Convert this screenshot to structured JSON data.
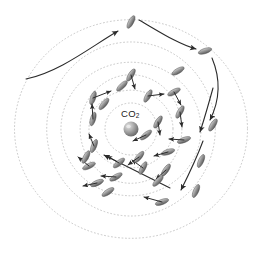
{
  "figure": {
    "background_color": "#ffffff",
    "width": 258,
    "height": 265
  },
  "center_label": {
    "text": "CO",
    "subscript": "2",
    "full_text": "CO2",
    "x": 121,
    "y": 108,
    "color": "#1a1a1a",
    "font_size": 9.5
  },
  "center_sphere": {
    "name": "co2-sphere",
    "cx": 131,
    "cy": 129,
    "r": 7.5,
    "fill_light": "#d8d8d8",
    "fill_mid": "#a8a8a8",
    "fill_dark": "#6f6f6f",
    "highlight_offset": [
      -2.5,
      -2.5
    ]
  },
  "rings": {
    "name": "dotted-orbital-rings",
    "color": "#b9b9b9",
    "stroke_width": 0.8,
    "dash": "0.9 2.6",
    "center": [
      131,
      129
    ],
    "count": 6,
    "radii": [
      26,
      40,
      53,
      68,
      86,
      112
    ],
    "wobble": [
      0.0,
      0.05,
      -0.04,
      0.03,
      -0.02,
      0.04
    ]
  },
  "particles": {
    "name": "rod-particles",
    "fill_light": "#c9c9c9",
    "fill_mid": "#9a9a9a",
    "fill_dark": "#5d5d5d",
    "stroke": "#4a4a4a",
    "rx": 7.0,
    "ry": 2.6,
    "count": 30,
    "items": [
      {
        "x": 131,
        "y": 22,
        "angle": -62,
        "arrow": {
          "dx": 0,
          "dy": 0,
          "show": false
        }
      },
      {
        "x": 205,
        "y": 51,
        "angle": -18,
        "arrow": {
          "dx": 0,
          "dy": 0,
          "show": false
        }
      },
      {
        "x": 213,
        "y": 125,
        "angle": -58,
        "arrow": {
          "dx": 0,
          "dy": 0,
          "show": false
        }
      },
      {
        "x": 196,
        "y": 191,
        "angle": -66,
        "arrow": {
          "dx": 0,
          "dy": 0,
          "show": false
        }
      },
      {
        "x": 162,
        "y": 202,
        "angle": -20,
        "arrow": {
          "dx": -18,
          "dy": -5,
          "show": true
        }
      },
      {
        "x": 131,
        "y": 75,
        "angle": -58,
        "arrow": {
          "dx": 4,
          "dy": 14,
          "show": true
        }
      },
      {
        "x": 93,
        "y": 98,
        "angle": -72,
        "arrow": {
          "dx": 18,
          "dy": -7,
          "show": true
        }
      },
      {
        "x": 148,
        "y": 96,
        "angle": -60,
        "arrow": {
          "dx": 16,
          "dy": -2,
          "show": true
        }
      },
      {
        "x": 174,
        "y": 92,
        "angle": -28,
        "arrow": {
          "dx": 7,
          "dy": 13,
          "show": true
        }
      },
      {
        "x": 180,
        "y": 112,
        "angle": -60,
        "arrow": {
          "dx": 2,
          "dy": 15,
          "show": true
        }
      },
      {
        "x": 184,
        "y": 140,
        "angle": -20,
        "arrow": {
          "dx": -15,
          "dy": -1,
          "show": true
        }
      },
      {
        "x": 168,
        "y": 152,
        "angle": -18,
        "arrow": {
          "dx": -14,
          "dy": 4,
          "show": true
        }
      },
      {
        "x": 166,
        "y": 170,
        "angle": -56,
        "arrow": {
          "dx": -10,
          "dy": 9,
          "show": true
        }
      },
      {
        "x": 143,
        "y": 168,
        "angle": -62,
        "arrow": {
          "dx": -11,
          "dy": -8,
          "show": true
        }
      },
      {
        "x": 116,
        "y": 177,
        "angle": -30,
        "arrow": {
          "dx": -15,
          "dy": -1,
          "show": true
        }
      },
      {
        "x": 97,
        "y": 183,
        "angle": -24,
        "arrow": {
          "dx": -14,
          "dy": 3,
          "show": true
        }
      },
      {
        "x": 89,
        "y": 166,
        "angle": -26,
        "arrow": {
          "dx": -11,
          "dy": -9,
          "show": true
        }
      },
      {
        "x": 94,
        "y": 146,
        "angle": -68,
        "arrow": {
          "dx": -5,
          "dy": -12,
          "show": true
        }
      },
      {
        "x": 93,
        "y": 119,
        "angle": -74,
        "arrow": {
          "dx": -1,
          "dy": -15,
          "show": true
        }
      },
      {
        "x": 119,
        "y": 163,
        "angle": -40,
        "arrow": {
          "dx": -12,
          "dy": -7,
          "show": true
        }
      },
      {
        "x": 146,
        "y": 135,
        "angle": -40,
        "arrow": {
          "dx": -13,
          "dy": 6,
          "show": true
        }
      },
      {
        "x": 139,
        "y": 157,
        "angle": -50,
        "arrow": {
          "dx": -11,
          "dy": 8,
          "show": true
        }
      },
      {
        "x": 158,
        "y": 181,
        "angle": -46,
        "arrow": {
          "dx": 0,
          "dy": 0,
          "show": false
        }
      },
      {
        "x": 86,
        "y": 157,
        "angle": -62,
        "arrow": {
          "dx": 0,
          "dy": 0,
          "show": false
        }
      },
      {
        "x": 122,
        "y": 86,
        "angle": -44,
        "arrow": {
          "dx": 0,
          "dy": 0,
          "show": false
        }
      },
      {
        "x": 201,
        "y": 161,
        "angle": -66,
        "arrow": {
          "dx": 0,
          "dy": 0,
          "show": false
        }
      },
      {
        "x": 158,
        "y": 122,
        "angle": -58,
        "arrow": {
          "dx": 2,
          "dy": 13,
          "show": true
        }
      },
      {
        "x": 108,
        "y": 192,
        "angle": -34,
        "arrow": {
          "dx": 0,
          "dy": 0,
          "show": false
        }
      },
      {
        "x": 178,
        "y": 71,
        "angle": -30,
        "arrow": {
          "dx": 0,
          "dy": 0,
          "show": false
        }
      },
      {
        "x": 104,
        "y": 104,
        "angle": -50,
        "arrow": {
          "dx": 0,
          "dy": 0,
          "show": false
        }
      }
    ]
  },
  "trajectories": {
    "name": "trajectory-arrows",
    "color": "#2b2b2b",
    "stroke_width": 1.1,
    "paths": [
      {
        "id": "entry-left-curve",
        "d": "M 26 79 C 60 72 92 46 118 31",
        "arrowhead": true
      },
      {
        "id": "top-to-right-curve",
        "d": "M 139 20 C 160 32 178 44 196 49",
        "arrowhead": true
      },
      {
        "id": "right-descend-curve",
        "d": "M 212 58 C 222 82 218 104 210 120",
        "arrowhead": true
      },
      {
        "id": "right-inner-descend",
        "d": "M 213 88 C 208 106 204 120 200 132",
        "arrowhead": true
      },
      {
        "id": "right-lower-descend",
        "d": "M 203 141 C 196 160 188 176 181 190",
        "arrowhead": true
      },
      {
        "id": "long-diagonal",
        "d": "M 170 188 L 104 155",
        "arrowhead": true
      }
    ]
  }
}
